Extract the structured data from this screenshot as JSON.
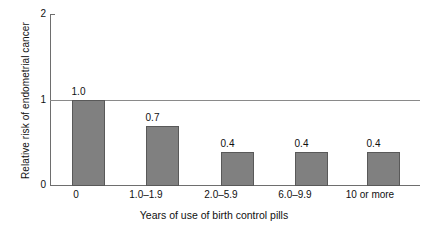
{
  "chart_data": {
    "type": "bar",
    "title": "",
    "xlabel": "Years of use of birth control pills",
    "ylabel": "Relative risk of endometrial cancer",
    "categories": [
      "0",
      "1.0–1.9",
      "2.0–5.9",
      "6.0–9.9",
      "10 or more"
    ],
    "values": [
      1.0,
      0.7,
      0.4,
      0.4,
      0.4
    ],
    "data_labels": [
      "1.0",
      "0.7",
      "0.4",
      "0.4",
      "0.4"
    ],
    "ylim": [
      0,
      2
    ],
    "yticks": [
      0,
      1,
      2
    ],
    "ytick_labels": [
      "0",
      "1",
      "2"
    ],
    "grid": false,
    "reference_line": 1,
    "legend": "none",
    "bar_color": "#808080",
    "bar_edge_color": "#595959",
    "axis_color": "#6e6e6e",
    "reference_line_color": "#8a8a8a"
  }
}
